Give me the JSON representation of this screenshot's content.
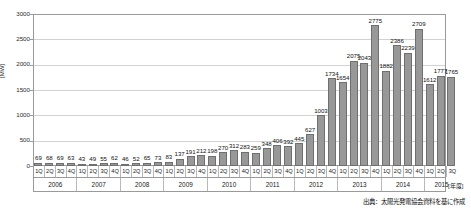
{
  "chart_data": {
    "type": "bar",
    "title": "",
    "xlabel": "[年度]",
    "ylabel": "[MW]",
    "ylim": [
      0,
      3000
    ],
    "ytick_values": [
      0,
      500,
      1000,
      1500,
      2000,
      2500,
      3000
    ],
    "ytick_labels": [
      "0",
      "500",
      "1000",
      "1500",
      "2000",
      "2500",
      "3000"
    ],
    "grid": true,
    "legend": "none",
    "bar_color": "#989898",
    "bar_edge_color": "#6f6f6f",
    "categories": [
      "1Q",
      "2Q",
      "3Q",
      "4Q",
      "1Q",
      "2Q",
      "3Q",
      "4Q",
      "1Q",
      "2Q",
      "3Q",
      "4Q",
      "1Q",
      "2Q",
      "3Q",
      "4Q",
      "1Q",
      "2Q",
      "3Q",
      "4Q",
      "1Q",
      "2Q",
      "3Q",
      "4Q",
      "1Q",
      "2Q",
      "3Q",
      "4Q",
      "1Q",
      "2Q",
      "3Q",
      "4Q",
      "1Q",
      "2Q",
      "3Q",
      "4Q",
      "1Q",
      "2Q",
      "3Q"
    ],
    "values": [
      69,
      68,
      69,
      63,
      43,
      49,
      55,
      62,
      46,
      52,
      65,
      73,
      83,
      137,
      191,
      212,
      198,
      270,
      312,
      283,
      259,
      348,
      406,
      392,
      445,
      627,
      1003,
      1734,
      1654,
      2075,
      2043,
      2775,
      1882,
      2386,
      2239,
      2709,
      1612,
      1777,
      1765
    ],
    "year_groups": [
      {
        "label": "2006",
        "quarters": 4
      },
      {
        "label": "2007",
        "quarters": 4
      },
      {
        "label": "2008",
        "quarters": 4
      },
      {
        "label": "2009",
        "quarters": 4
      },
      {
        "label": "2010",
        "quarters": 4
      },
      {
        "label": "2011",
        "quarters": 4
      },
      {
        "label": "2012",
        "quarters": 4
      },
      {
        "label": "2013",
        "quarters": 4
      },
      {
        "label": "2014",
        "quarters": 4
      },
      {
        "label": "2015",
        "quarters": 3
      }
    ]
  },
  "source_note": "出典：太陽光発電協会資料を基に作成"
}
